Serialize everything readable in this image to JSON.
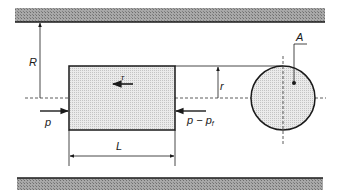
{
  "diagram": {
    "labels": {
      "pipe_radius": "R",
      "plug_radius": "r",
      "shear_stress": "τ",
      "inlet_pressure": "p",
      "outlet_pressure_main": "p − p",
      "outlet_pressure_sub": "f",
      "length": "L",
      "area": "A"
    },
    "colors": {
      "line": "#1a1a1a",
      "wall_fill": "#9a9a9a",
      "plug_fill": "#e2e2e2"
    }
  }
}
